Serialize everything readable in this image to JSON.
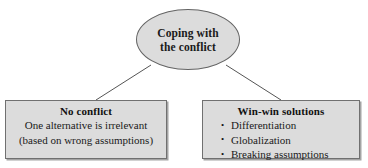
{
  "diagram": {
    "type": "hierarchy-tree",
    "background_color": "#ffffff",
    "node_fill_color": "#dcdcdc",
    "node_border_color": "#707070",
    "connector_color": "#555555",
    "root": {
      "shape": "ellipse",
      "line1": "Coping with",
      "line2": "the conflict"
    },
    "children": [
      {
        "shape": "rectangle",
        "title": "No conflict",
        "lines": [
          "One alternative is irrelevant",
          "(based on wrong assumptions)"
        ]
      },
      {
        "shape": "rectangle",
        "title": "Win-win solutions",
        "bullets": [
          "Differentiation",
          "Globalization",
          "Breaking assumptions"
        ]
      }
    ]
  }
}
